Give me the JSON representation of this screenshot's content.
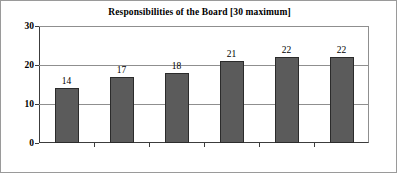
{
  "chart_data": {
    "type": "bar",
    "title": "Responsibilities of the Board [30 maximum]",
    "xlabel": "",
    "ylabel": "",
    "categories": [
      "Senegal",
      "Mauritius",
      "Ghana",
      "Egypt",
      "Jordan",
      "South Africa"
    ],
    "values": [
      14,
      17,
      18,
      21,
      22,
      22
    ],
    "value_labels": [
      "14",
      "17",
      "18",
      "21",
      "22",
      "22"
    ],
    "ylim": [
      0,
      30
    ],
    "yticks": [
      0,
      10,
      20,
      30
    ],
    "ytick_labels": [
      "0",
      "10",
      "20",
      "30"
    ],
    "grid": "horizontal",
    "legend": "none",
    "colors": {
      "bar_fill": "#5b5b5b",
      "bar_border": "#2b2b2b",
      "gridline": "#8f8f8f",
      "axis": "#3c3c3c",
      "text": "#000000",
      "background": "#ffffff",
      "figure_border": "#9a9a9a"
    }
  }
}
